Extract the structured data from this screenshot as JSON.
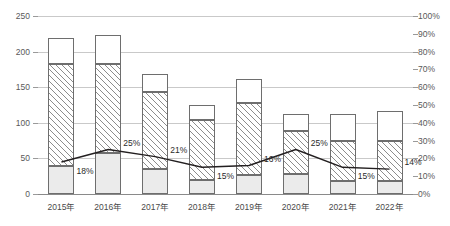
{
  "chart_data": {
    "type": "bar",
    "title": "",
    "xlabel": "",
    "ylabel": "",
    "categories": [
      "2015年",
      "2016年",
      "2017年",
      "2018年",
      "2019年",
      "2020年",
      "2021年",
      "2022年"
    ],
    "left_axis": {
      "ticks": [
        0,
        50,
        100,
        150,
        200,
        250
      ],
      "tick_labels": [
        "0",
        "50",
        "100",
        "150",
        "200",
        "250"
      ],
      "ylim": [
        0,
        250
      ]
    },
    "right_axis": {
      "ticks": [
        0,
        10,
        20,
        30,
        40,
        50,
        60,
        70,
        80,
        90,
        100
      ],
      "tick_labels": [
        "0%",
        "10%",
        "20%",
        "30%",
        "40%",
        "50%",
        "60%",
        "70%",
        "80%",
        "90%",
        "100%"
      ],
      "ylim": [
        0,
        100
      ]
    },
    "grid": true,
    "legend_position": "none",
    "series": [
      {
        "name": "segment-bottom",
        "type": "bar",
        "stack": "total",
        "pattern": "solid-light-gray",
        "axis": "left",
        "values": [
          39,
          57,
          35,
          20,
          27,
          28,
          18,
          18
        ]
      },
      {
        "name": "segment-middle",
        "type": "bar",
        "stack": "total",
        "pattern": "diagonal-hatch",
        "axis": "left",
        "values": [
          144,
          125,
          108,
          84,
          101,
          60,
          56,
          56
        ]
      },
      {
        "name": "segment-top",
        "type": "bar",
        "stack": "total",
        "pattern": "dotted",
        "axis": "left",
        "values": [
          36,
          42,
          25,
          21,
          34,
          25,
          39,
          42
        ]
      },
      {
        "name": "percentage-line",
        "type": "line",
        "axis": "right",
        "values": [
          18,
          25,
          21,
          15,
          16,
          25,
          15,
          14
        ],
        "data_labels": [
          "18%",
          "25%",
          "21%",
          "15%",
          "16%",
          "25%",
          "15%",
          "14%"
        ]
      }
    ],
    "stack_totals": [
      219,
      224,
      168,
      125,
      162,
      113,
      113,
      116
    ]
  }
}
